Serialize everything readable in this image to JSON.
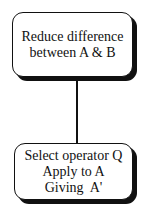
{
  "diagram": {
    "nodes": [
      {
        "id": "goal",
        "lines": [
          "Reduce difference",
          "between A & B"
        ]
      },
      {
        "id": "operator",
        "lines": [
          "Select operator Q",
          "Apply to A",
          "Giving  A'"
        ]
      }
    ],
    "edges": [
      {
        "from": "goal",
        "to": "operator"
      }
    ],
    "colors": {
      "stroke": "#111111",
      "background": "#ffffff"
    }
  }
}
